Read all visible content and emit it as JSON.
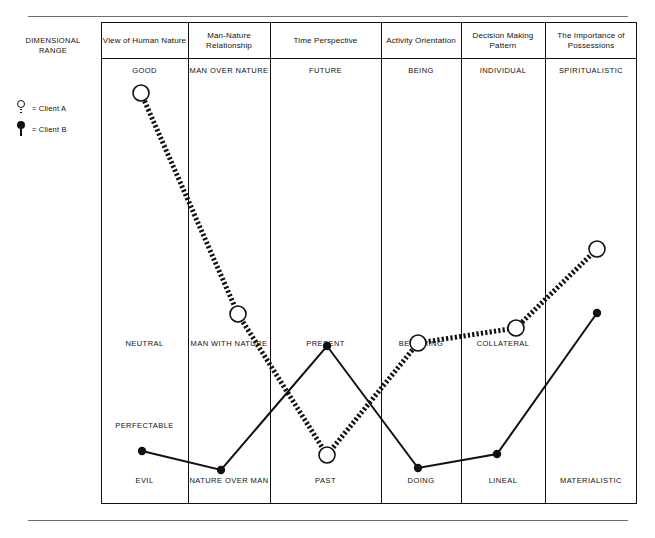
{
  "side": {
    "dimensional_range_label": "DIMENSIONAL RANGE",
    "legend": [
      {
        "marker": "open-circle-dotted",
        "label": "= Client A"
      },
      {
        "marker": "filled-circle-solid",
        "label": "= Client B"
      }
    ]
  },
  "chart_data": {
    "type": "line",
    "title": "",
    "xlabel": "",
    "ylabel": "DIMENSIONAL RANGE",
    "grid": false,
    "legend_position": "left",
    "categories": [
      "View of Human Nature",
      "Man-Nature Relationship",
      "Time Perspective",
      "Activity Orientation",
      "Decision Making Pattern",
      "The Importance of Possessions"
    ],
    "tier_labels": {
      "high": [
        "GOOD",
        "MAN OVER NATURE",
        "FUTURE",
        "BEING",
        "INDIVIDUAL",
        "SPIRITUALISTIC"
      ],
      "middle": [
        "NEUTRAL",
        "MAN WITH NATURE",
        "PRESENT",
        "BECOMING",
        "COLLATERAL",
        ""
      ],
      "low_mid": [
        "PERFECTABLE",
        "",
        "",
        "",
        "",
        ""
      ],
      "low": [
        "EVIL",
        "NATURE OVER MAN",
        "PAST",
        "DOING",
        "LINEAL",
        "MATERIALISTIC"
      ]
    },
    "y_tiers": [
      "GOOD / HIGH",
      "NEUTRAL / MIDDLE",
      "PERFECTABLE",
      "EVIL / LOW"
    ],
    "series": [
      {
        "name": "Client A",
        "style": "dotted",
        "marker": "open-circle",
        "points": [
          {
            "category": "View of Human Nature",
            "value_label": "GOOD",
            "x": 141,
            "y": 93
          },
          {
            "category": "Man-Nature Relationship",
            "value_label": "between MAN WITH NATURE and MAN OVER NATURE",
            "x": 238,
            "y": 314
          },
          {
            "category": "Time Perspective",
            "value_label": "PAST",
            "x": 327,
            "y": 455
          },
          {
            "category": "Activity Orientation",
            "value_label": "BECOMING",
            "x": 418,
            "y": 343
          },
          {
            "category": "Decision Making Pattern",
            "value_label": "COLLATERAL",
            "x": 516,
            "y": 328
          },
          {
            "category": "The Importance of Possessions",
            "value_label": "toward SPIRITUALISTIC",
            "x": 597,
            "y": 249
          }
        ]
      },
      {
        "name": "Client B",
        "style": "solid",
        "marker": "filled-circle",
        "points": [
          {
            "category": "View of Human Nature",
            "value_label": "PERFECTABLE / EVIL",
            "x": 142,
            "y": 451
          },
          {
            "category": "Man-Nature Relationship",
            "value_label": "NATURE OVER MAN",
            "x": 221,
            "y": 470
          },
          {
            "category": "Time Perspective",
            "value_label": "PRESENT",
            "x": 327,
            "y": 346
          },
          {
            "category": "Activity Orientation",
            "value_label": "DOING",
            "x": 418,
            "y": 468
          },
          {
            "category": "Decision Making Pattern",
            "value_label": "LINEAL",
            "x": 497,
            "y": 454
          },
          {
            "category": "The Importance of Possessions",
            "value_label": "between MATERIALISTIC and SPIRITUALISTIC",
            "x": 597,
            "y": 313
          }
        ]
      }
    ]
  }
}
